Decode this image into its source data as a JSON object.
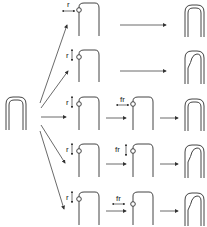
{
  "diagram": {
    "type": "flow",
    "source_node": "hairpin-loop",
    "rows": [
      {
        "step1_label": "r",
        "step1_arrow": "horizontal",
        "step2_label": null,
        "outcome": "intact-loop"
      },
      {
        "step1_label": "r",
        "step1_arrow": "vertical",
        "step2_label": null,
        "outcome": "bent-loop"
      },
      {
        "step1_label": "r",
        "step1_arrow": "vertical",
        "step2_label": "fr",
        "step2_arrow": "horizontal",
        "outcome": "intact-loop"
      },
      {
        "step1_label": "r",
        "step1_arrow": "vertical",
        "step2_label": "fr",
        "step2_arrow": "vertical",
        "outcome": "bent-loop"
      },
      {
        "step1_label": "r",
        "step1_arrow": "vertical",
        "step2_label": "fr",
        "step2_arrow": "horizontal",
        "outcome": "bent-loop"
      }
    ]
  },
  "labels": {
    "r": "r",
    "fr": "fr"
  }
}
